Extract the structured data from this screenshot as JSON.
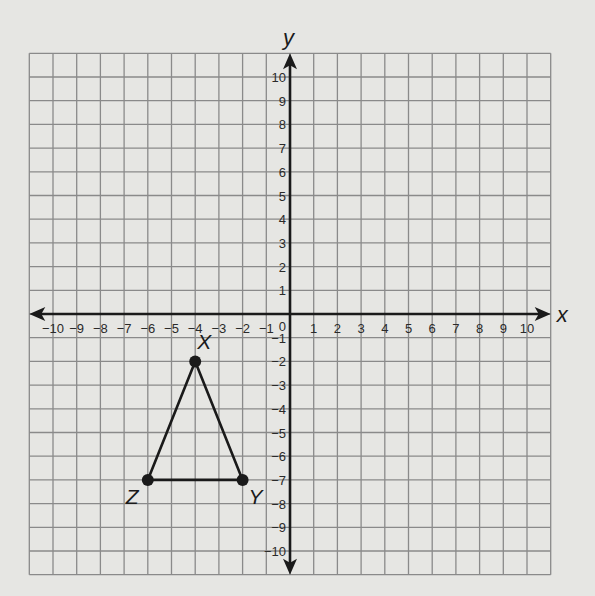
{
  "axes": {
    "x_label": "x",
    "y_label": "y",
    "x_ticks": [
      -10,
      -9,
      -8,
      -7,
      -6,
      -5,
      -4,
      -3,
      -2,
      -1,
      1,
      2,
      3,
      4,
      5,
      6,
      7,
      8,
      9,
      10
    ],
    "y_ticks": [
      10,
      9,
      8,
      7,
      6,
      5,
      4,
      3,
      2,
      1,
      -1,
      -2,
      -3,
      -4,
      -5,
      -6,
      -7,
      -8,
      -9,
      -10
    ],
    "origin_label": "0",
    "grid_range": [
      -11,
      11
    ]
  },
  "triangle": {
    "vertices": [
      {
        "name": "X",
        "x": -4,
        "y": -2
      },
      {
        "name": "Y",
        "x": -2,
        "y": -7
      },
      {
        "name": "Z",
        "x": -6,
        "y": -7
      }
    ]
  },
  "colors": {
    "background": "#e6e6e3",
    "grid": "#8a8a8a",
    "axis": "#1a1a1a",
    "shape": "#1a1a1a"
  }
}
